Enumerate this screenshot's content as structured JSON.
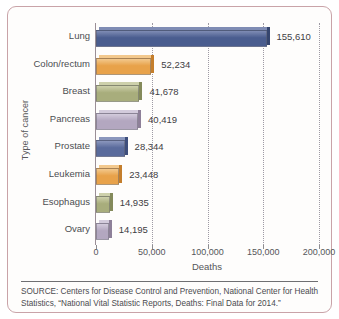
{
  "chart_data": {
    "type": "bar",
    "orientation": "horizontal",
    "title": "",
    "xlabel": "Deaths",
    "ylabel": "Type of cancer",
    "xlim": [
      0,
      200000
    ],
    "xticks": [
      "0",
      "50,000",
      "100,000",
      "150,000",
      "200,000"
    ],
    "xtick_values": [
      0,
      50000,
      100000,
      150000,
      200000
    ],
    "grid": "vertical dotted gridlines at each tick",
    "legend": "none",
    "categories": [
      "Lung",
      "Colon/rectum",
      "Breast",
      "Pancreas",
      "Prostate",
      "Leukemia",
      "Esophagus",
      "Ovary"
    ],
    "values": [
      155610,
      52234,
      41678,
      40419,
      28344,
      23448,
      14935,
      14195
    ],
    "value_labels": [
      "155,610",
      "52,234",
      "41,678",
      "40,419",
      "28,344",
      "23,448",
      "14,935",
      "14,195"
    ],
    "bar_colors": [
      "#4a5d8f",
      "#e8a24a",
      "#a8ad7c",
      "#b3a7c0",
      "#5a6b9c",
      "#e8a24a",
      "#a8ad7c",
      "#b3a7c0"
    ]
  },
  "bars": [
    {
      "label": "Lung",
      "value": 155610,
      "value_label": "155,610",
      "color": "#4a5d8f",
      "color_top": "#7f8cb4",
      "color_side": "#35456e"
    },
    {
      "label": "Colon/rectum",
      "value": 52234,
      "value_label": "52,234",
      "color": "#e8a24a",
      "color_top": "#f3c98e",
      "color_side": "#c47e2c"
    },
    {
      "label": "Breast",
      "value": 41678,
      "value_label": "41,678",
      "color": "#a8ad7c",
      "color_top": "#cdd0ab",
      "color_side": "#848a5b"
    },
    {
      "label": "Pancreas",
      "value": 40419,
      "value_label": "40,419",
      "color": "#b3a7c0",
      "color_top": "#d3cbdc",
      "color_side": "#8e8099"
    },
    {
      "label": "Prostate",
      "value": 28344,
      "value_label": "28,344",
      "color": "#5a6b9c",
      "color_top": "#8b97bd",
      "color_side": "#3f4f7c"
    },
    {
      "label": "Leukemia",
      "value": 23448,
      "value_label": "23,448",
      "color": "#e8a24a",
      "color_top": "#f3c98e",
      "color_side": "#c47e2c"
    },
    {
      "label": "Esophagus",
      "value": 14935,
      "value_label": "14,935",
      "color": "#a8ad7c",
      "color_top": "#cdd0ab",
      "color_side": "#848a5b"
    },
    {
      "label": "Ovary",
      "value": 14195,
      "value_label": "14,195",
      "color": "#b3a7c0",
      "color_top": "#d3cbdc",
      "color_side": "#8e8099"
    }
  ],
  "axes": {
    "x_title": "Deaths",
    "y_title": "Type of cancer",
    "x_ticks": [
      "0",
      "50,000",
      "100,000",
      "150,000",
      "200,000"
    ]
  },
  "source": {
    "text": "SOURCE: Centers for Disease Control and Prevention, National Center for Health Statistics, “National Vital Statistic Reports, Deaths: Final Data for 2014.”"
  },
  "colors": {
    "card_border": "#c9a3a8",
    "axis": "#9b8f97",
    "gridline": "#9e9aa4",
    "text": "#4c4d51"
  }
}
